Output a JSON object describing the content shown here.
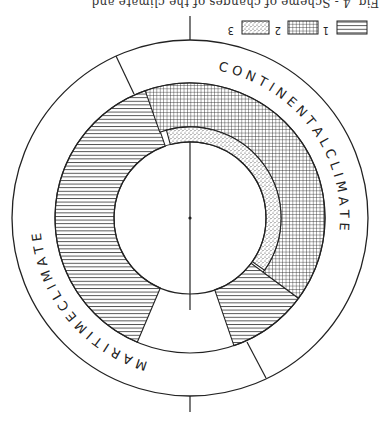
{
  "caption": "Fig. 4 - Scheme of changes of the climate and ...",
  "legend": [
    {
      "id": "1",
      "label": "1",
      "pattern": "horizontal-lines"
    },
    {
      "id": "2",
      "label": "2",
      "pattern": "crosshatch"
    },
    {
      "id": "3",
      "label": "3",
      "pattern": "stipple"
    }
  ],
  "ring_labels": {
    "continental": "C O N T I N E N T A L   C L I M A T E",
    "maritime": "M A R I T I M E   C L I M A T E"
  },
  "colors": {
    "ink": "#222222",
    "background": "#ffffff"
  },
  "geometry": {
    "center": [
      190,
      218
    ],
    "outer_radius": 178,
    "band_outer_radius": 135,
    "crosshatch_inner_radius": 91,
    "inner_radius": 76,
    "orientation": "rotated 180 degrees"
  },
  "segments": [
    {
      "pattern": "horizontal-lines",
      "from_deg": 113,
      "to_deg": 251,
      "r_inner": 76,
      "r_outer": 135
    },
    {
      "pattern": "horizontal-lines",
      "from_deg": 36.5,
      "to_deg": 71,
      "r_inner": 76,
      "r_outer": 135
    },
    {
      "pattern": "crosshatch",
      "from_deg": -109.4,
      "to_deg": 36.5,
      "r_inner": 91,
      "r_outer": 135
    },
    {
      "pattern": "stipple",
      "from_deg": -105,
      "to_deg": 35,
      "r_inner": 76,
      "r_outer": 91
    }
  ]
}
